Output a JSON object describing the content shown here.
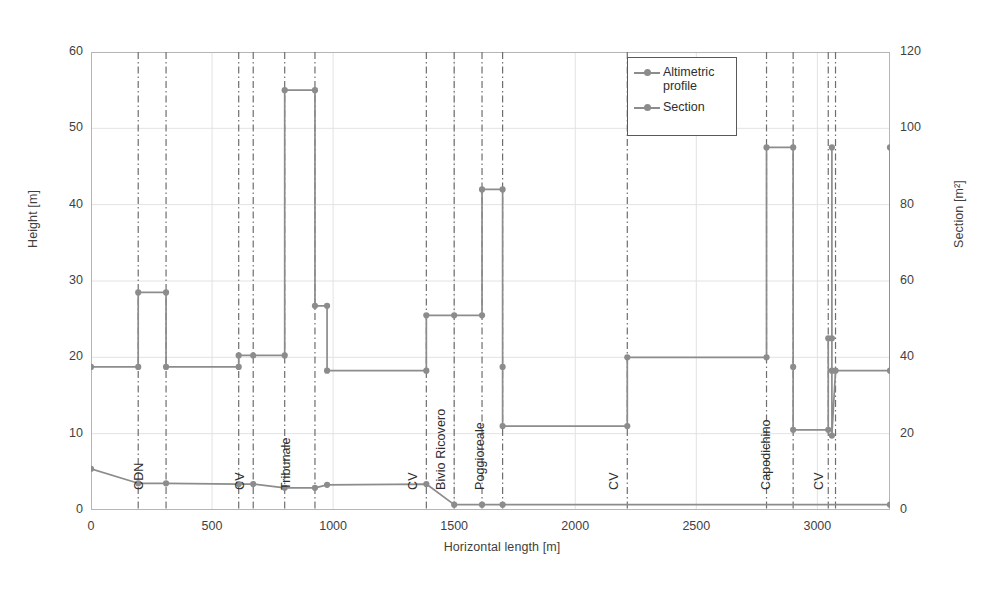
{
  "chart_data": {
    "type": "line",
    "title": "",
    "xlabel": "Horizontal length [m]",
    "ylabel": "Height [m]",
    "y2label": "Section [m²]",
    "xlim": [
      0,
      3300
    ],
    "ylim": [
      0,
      60
    ],
    "y2lim": [
      0,
      120
    ],
    "xticks": [
      0,
      500,
      1000,
      1500,
      2000,
      2500,
      3000
    ],
    "yticks": [
      0,
      10,
      20,
      30,
      40,
      50,
      60
    ],
    "y2ticks": [
      0,
      20,
      40,
      60,
      80,
      100,
      120
    ],
    "grid": true,
    "legend_position": "upper-right-inside",
    "series": [
      {
        "name": "Altimetric profile",
        "axis": "left",
        "color": "#8c8c8c",
        "points": [
          [
            0,
            5.4
          ],
          [
            195,
            3.5
          ],
          [
            310,
            3.5
          ],
          [
            610,
            3.4
          ],
          [
            670,
            3.4
          ],
          [
            800,
            2.9
          ],
          [
            925,
            2.9
          ],
          [
            975,
            3.3
          ],
          [
            1385,
            3.4
          ],
          [
            1500,
            0.7
          ],
          [
            1615,
            0.7
          ],
          [
            1700,
            0.7
          ],
          [
            3300,
            0.7
          ]
        ]
      },
      {
        "name": "Section",
        "axis": "right",
        "color": "#8c8c8c",
        "points": [
          [
            0,
            37.5
          ],
          [
            195,
            37.5
          ],
          [
            195,
            57
          ],
          [
            310,
            57
          ],
          [
            310,
            37.5
          ],
          [
            610,
            37.5
          ],
          [
            610,
            40.5
          ],
          [
            670,
            40.5
          ],
          [
            800,
            40.5
          ],
          [
            800,
            110
          ],
          [
            925,
            110
          ],
          [
            925,
            53.5
          ],
          [
            975,
            53.5
          ],
          [
            975,
            36.5
          ],
          [
            1385,
            36.5
          ],
          [
            1385,
            51
          ],
          [
            1500,
            51
          ],
          [
            1615,
            51
          ],
          [
            1615,
            84
          ],
          [
            1700,
            84
          ],
          [
            1700,
            37.5
          ],
          [
            1700,
            22
          ],
          [
            2215,
            22
          ],
          [
            2215,
            40
          ],
          [
            2790,
            40
          ],
          [
            2790,
            95
          ],
          [
            2900,
            95
          ],
          [
            2900,
            37.5
          ],
          [
            2900,
            21
          ],
          [
            3045,
            21
          ],
          [
            3045,
            45
          ],
          [
            3060,
            45
          ],
          [
            3060,
            95
          ],
          [
            3060,
            36.5
          ],
          [
            3060,
            19.5
          ],
          [
            3075,
            36.5
          ],
          [
            3300,
            36.5
          ],
          [
            3300,
            95
          ]
        ]
      }
    ],
    "vertical_markers": [
      {
        "label": "CDN",
        "x": 195,
        "label_x": 250
      },
      {
        "label": "CDN-end",
        "x": 310,
        "label_x": null
      },
      {
        "label": "CV",
        "x": 610,
        "label_x": 670
      },
      {
        "label": "CV-end",
        "x": 670,
        "label_x": null
      },
      {
        "label": "Tribunale",
        "x": 800,
        "label_x": 860
      },
      {
        "label": "Tribunale-end",
        "x": 925,
        "label_x": null
      },
      {
        "label": "CV",
        "x": 1385,
        "label_x": 1385
      },
      {
        "label": "Bivio Ricovero",
        "x": 1500,
        "label_x": 1500
      },
      {
        "label": "Poggioreale",
        "x": 1615,
        "label_x": 1660
      },
      {
        "label": "Poggioreale-end",
        "x": 1700,
        "label_x": null
      },
      {
        "label": "CV",
        "x": 2215,
        "label_x": 2215
      },
      {
        "label": "Capodichino",
        "x": 2790,
        "label_x": 2840
      },
      {
        "label": "Capodichino-end",
        "x": 2900,
        "label_x": null
      },
      {
        "label": "CV",
        "x": 3045,
        "label_x": 3060
      },
      {
        "label": "CV-end",
        "x": 3075,
        "label_x": null
      }
    ]
  },
  "legend": {
    "items": [
      {
        "label": "Altimetric profile"
      },
      {
        "label": "Section"
      }
    ]
  },
  "colors": {
    "series": "#8c8c8c",
    "grid": "#e2e2e2",
    "axis": "#b5b5b5",
    "marker_line": "#6e6e6e",
    "text": "#3f3f3f"
  }
}
